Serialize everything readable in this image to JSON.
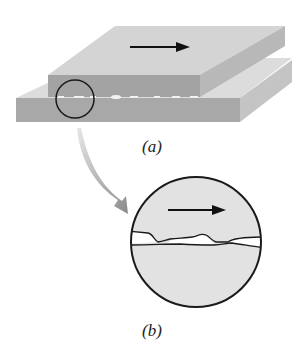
{
  "figure": {
    "labels": {
      "a": "(a)",
      "b": "(b)"
    },
    "colors": {
      "top_face": "#d6d6d6",
      "front_face": "#a9a9a9",
      "side_face": "#bdbdbd",
      "lower_top_face": "#dedede",
      "circle_fill": "#e2e2e2",
      "outline": "#1a1a1a",
      "curved_arrow": "#8c8c8c",
      "gap": "#ffffff"
    },
    "icons": {
      "motion_arrow": "right-arrow",
      "zoom_arrow": "curved-down-right-arrow"
    }
  }
}
